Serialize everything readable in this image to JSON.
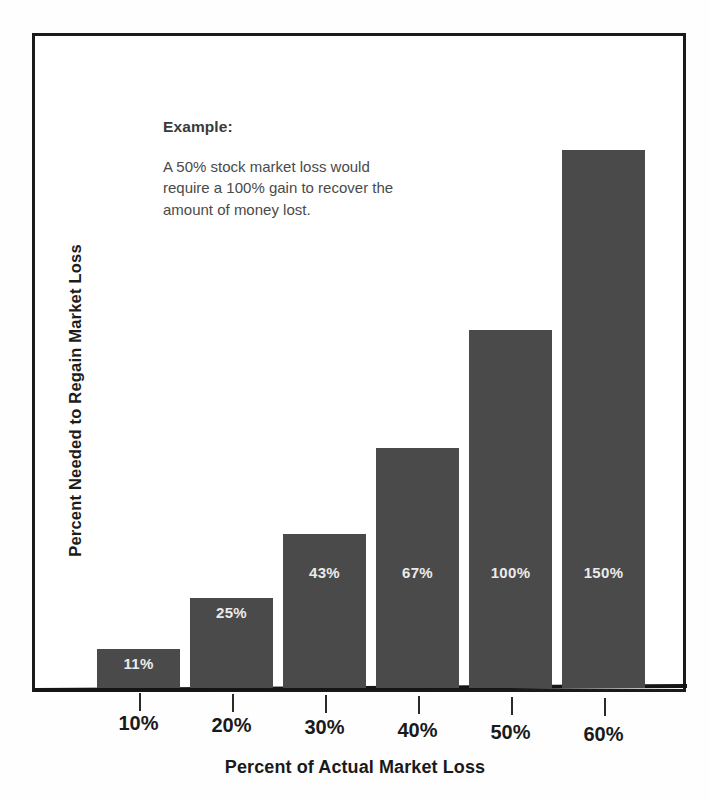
{
  "annotation": {
    "title": "Example:",
    "body": "A 50% stock market loss would require a 100% gain to recover the amount of money lost."
  },
  "axes": {
    "y_title": "Percent Needed to Regain Market Loss",
    "x_title": "Percent of Actual Market Loss"
  },
  "chart_data": {
    "type": "bar",
    "title": "",
    "subtitle": "",
    "xlabel": "Percent of Actual Market Loss",
    "ylabel": "Percent Needed to Regain Market Loss",
    "categories": [
      "10%",
      "20%",
      "30%",
      "40%",
      "50%",
      "60%"
    ],
    "values": [
      11,
      25,
      43,
      67,
      100,
      150
    ],
    "value_labels": [
      "11%",
      "25%",
      "43%",
      "67%",
      "100%",
      "150%"
    ],
    "ylim": [
      0,
      182
    ],
    "grid": false,
    "legend": null,
    "bar_color": "#4a4a4a",
    "value_label_color": "#ebebeb",
    "annotations": [
      "Example:",
      "A 50% stock market loss would require a 100% gain to recover the amount of money lost."
    ]
  }
}
